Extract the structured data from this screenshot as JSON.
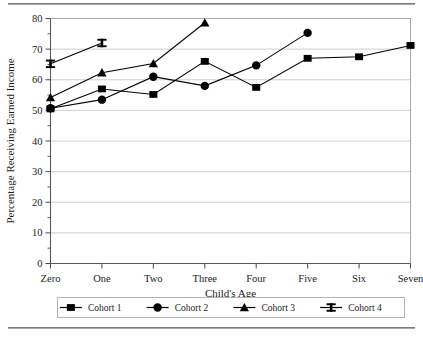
{
  "figure": {
    "top_rule": "horizontal-rule",
    "bottom_rule": "horizontal-rule"
  },
  "chart_data": {
    "type": "line",
    "title": "",
    "xlabel": "Child's Age",
    "ylabel": "Percentage Receiving Earned Income",
    "categories": [
      "Zero",
      "One",
      "Two",
      "Three",
      "Four",
      "Five",
      "Six",
      "Seven"
    ],
    "ylim": [
      0,
      80
    ],
    "yticks": [
      0,
      10,
      20,
      30,
      40,
      50,
      60,
      70,
      80
    ],
    "ytick_labels": [
      "0",
      "10",
      "20",
      "30",
      "40",
      "50",
      "60",
      "70",
      "80"
    ],
    "yminor_ticks": [
      5,
      15,
      25,
      35,
      45,
      55,
      65,
      75
    ],
    "grid": "horizontal",
    "legend_position": "bottom",
    "series": [
      {
        "name": "Cohort 1",
        "marker": "square",
        "color": "#000000",
        "x": [
          "Zero",
          "One",
          "Two",
          "Three",
          "Four",
          "Five",
          "Six",
          "Seven"
        ],
        "values": [
          50.5,
          57.0,
          55.2,
          66.0,
          57.5,
          67.0,
          67.5,
          71.2
        ]
      },
      {
        "name": "Cohort 2",
        "marker": "circle",
        "color": "#000000",
        "x": [
          "Zero",
          "One",
          "Two",
          "Three",
          "Four",
          "Five"
        ],
        "values": [
          50.7,
          53.5,
          61.0,
          58.0,
          64.7,
          75.3
        ]
      },
      {
        "name": "Cohort 3",
        "marker": "triangle",
        "color": "#000000",
        "x": [
          "Zero",
          "One",
          "Two",
          "Three"
        ],
        "values": [
          54.2,
          62.3,
          65.3,
          78.6
        ]
      },
      {
        "name": "Cohort 4",
        "marker": "ibeam",
        "color": "#000000",
        "x": [
          "Zero",
          "One"
        ],
        "values": [
          65.2,
          72.0
        ]
      }
    ]
  },
  "legend": {
    "items": [
      {
        "label": "Cohort 1",
        "marker": "square"
      },
      {
        "label": "Cohort 2",
        "marker": "circle"
      },
      {
        "label": "Cohort 3",
        "marker": "triangle"
      },
      {
        "label": "Cohort 4",
        "marker": "ibeam"
      }
    ]
  }
}
